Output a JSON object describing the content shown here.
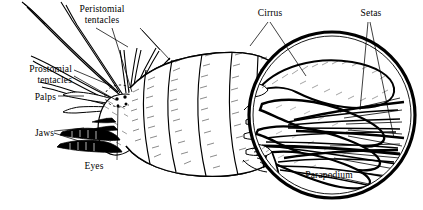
{
  "figure": {
    "background_color": "#ffffff",
    "ink_color": "#000000"
  },
  "labels": {
    "peristomial_tentacles": "Peristomial\ntentacles",
    "peristomial_tentacles_line1": "Peristomial",
    "peristomial_tentacles_line2": "tentacles",
    "prostomial_tentacles_line1": "Prostomial",
    "prostomial_tentacles_line2": "tentacles",
    "palps": "Palps",
    "jaws": "Jaws",
    "eyes": "Eyes",
    "cirrus": "Cirrus",
    "setas": "Setas",
    "parapodium": "Parapodium"
  },
  "inset": {
    "shape": "circle",
    "center_x": 332,
    "center_y": 115,
    "radius": 86,
    "outline_color": "#000000",
    "content": "magnified-parapodium-with-setae"
  }
}
